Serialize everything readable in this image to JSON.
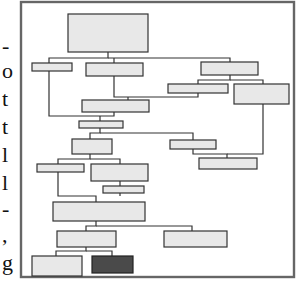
{
  "figure": {
    "type": "flowchart",
    "side_text_fragments": [
      "-",
      "o",
      "t",
      "t",
      "l",
      "l",
      "-",
      ",",
      "g"
    ],
    "colors": {
      "frame": "#666666",
      "box_fill": "#e8e8e8",
      "box_highlight": "#4a4a4a",
      "line": "#333333"
    },
    "nodes_count": 20,
    "highlighted_node": "bottom-right leaf (dark)"
  }
}
